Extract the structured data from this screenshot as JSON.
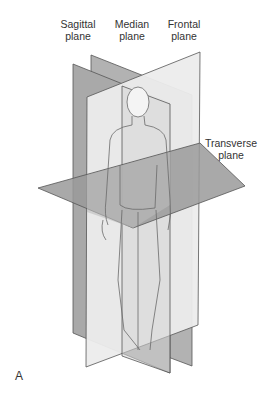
{
  "labels": {
    "sagittal_line1": "Sagittal",
    "sagittal_line2": "plane",
    "median_line1": "Median",
    "median_line2": "plane",
    "frontal_line1": "Frontal",
    "frontal_line2": "plane",
    "transverse_line1": "Transverse",
    "transverse_line2": "plane",
    "panel": "A"
  },
  "colors": {
    "dark_plane": "#a9a9a9",
    "mid_plane": "#c4c4c4",
    "light_plane": "#ececec",
    "outline": "#555555"
  }
}
